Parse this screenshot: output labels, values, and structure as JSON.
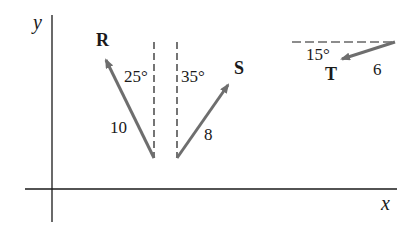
{
  "axes": {
    "x_label": "x",
    "y_label": "y",
    "color": "#1a1a1a"
  },
  "vectors": [
    {
      "name": "R",
      "magnitude_label": "10",
      "angle_label": "25°",
      "reference": "vertical",
      "direction": "up-left",
      "color": "#6e6e6e"
    },
    {
      "name": "S",
      "magnitude_label": "8",
      "angle_label": "35°",
      "reference": "vertical",
      "direction": "up-right",
      "color": "#6e6e6e"
    },
    {
      "name": "T",
      "magnitude_label": "6",
      "angle_label": "15°",
      "reference": "horizontal",
      "direction": "down-left",
      "color": "#6e6e6e"
    }
  ]
}
